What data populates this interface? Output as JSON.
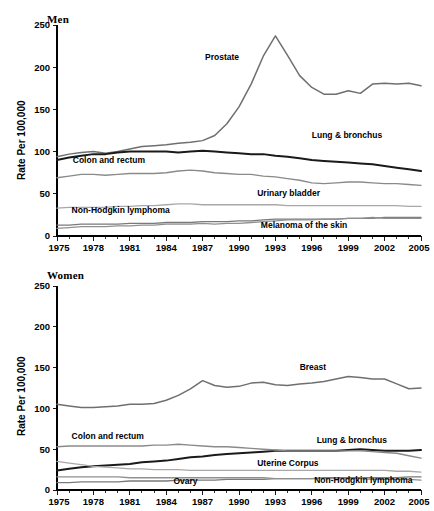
{
  "figure": {
    "background": "#ffffff",
    "panels": [
      "Men",
      "Women"
    ]
  },
  "men": {
    "title": "Men",
    "ylabel": "Rate Per 100,000"
  },
  "women": {
    "title": "Women",
    "ylabel": "Rate Per 100,000"
  },
  "chart_data": [
    {
      "type": "line",
      "title": "Men",
      "xlabel": "",
      "ylabel": "Rate Per 100,000",
      "xlim": [
        1975,
        2005
      ],
      "ylim": [
        0,
        250
      ],
      "yticks": [
        0,
        50,
        100,
        150,
        200,
        250
      ],
      "xticks": [
        1975,
        1978,
        1981,
        1984,
        1987,
        1990,
        1993,
        1996,
        1999,
        2002,
        2005
      ],
      "xtick_minor_step": 1,
      "grid": false,
      "legend": "inline-annotations",
      "x": [
        1975,
        1976,
        1977,
        1978,
        1979,
        1980,
        1981,
        1982,
        1983,
        1984,
        1985,
        1986,
        1987,
        1988,
        1989,
        1990,
        1991,
        1992,
        1993,
        1994,
        1995,
        1996,
        1997,
        1998,
        1999,
        2000,
        2001,
        2002,
        2003,
        2004,
        2005
      ],
      "series": [
        {
          "name": "Prostate",
          "color": "#6f6f6f",
          "width": 1.5,
          "label_x": 1987.2,
          "label_y": 208,
          "values": [
            94,
            97,
            99,
            100,
            98,
            100,
            103,
            106,
            107,
            108,
            110,
            111,
            113,
            119,
            133,
            153,
            180,
            213,
            237,
            214,
            190,
            176,
            168,
            168,
            172,
            169,
            180,
            181,
            180,
            181,
            178,
            167,
            159,
            152,
            147
          ]
        },
        {
          "name": "Lung & bronchus",
          "color": "#1a1a1a",
          "width": 2.0,
          "label_x": 1996.0,
          "label_y": 116,
          "values": [
            90,
            93,
            95,
            97,
            97,
            99,
            100,
            100,
            100,
            100,
            99,
            100,
            101,
            100,
            99,
            98,
            97,
            97,
            95,
            94,
            92,
            90,
            89,
            88,
            87,
            86,
            85,
            83,
            81,
            79,
            77,
            74,
            72,
            70
          ]
        },
        {
          "name": "Colon and rectum",
          "color": "#8a8a8a",
          "width": 1.4,
          "label_x": 1976.3,
          "label_y": 86,
          "values": [
            69,
            71,
            73,
            73,
            72,
            73,
            74,
            74,
            74,
            75,
            77,
            78,
            77,
            75,
            74,
            73,
            73,
            71,
            70,
            68,
            66,
            63,
            62,
            63,
            64,
            64,
            63,
            62,
            62,
            61,
            60,
            58,
            56,
            54,
            52
          ]
        },
        {
          "name": "Urinary bladder",
          "color": "#a8a8a8",
          "width": 1.3,
          "label_x": 1991.5,
          "label_y": 47,
          "values": [
            33,
            34,
            34,
            34,
            34,
            35,
            35,
            36,
            36,
            37,
            38,
            38,
            37,
            37,
            37,
            37,
            37,
            37,
            37,
            36,
            36,
            36,
            36,
            36,
            36,
            36,
            36,
            36,
            36,
            35,
            35,
            35,
            35,
            34,
            34
          ]
        },
        {
          "name": "Non-Hodgkin lymphoma",
          "color": "#7a7a7a",
          "width": 1.3,
          "label_x": 1976.2,
          "label_y": 27,
          "values": [
            13,
            13,
            14,
            14,
            14,
            14,
            15,
            15,
            15,
            16,
            16,
            16,
            17,
            17,
            17,
            18,
            18,
            19,
            20,
            20,
            20,
            20,
            20,
            20,
            21,
            21,
            21,
            22,
            22,
            22,
            22,
            22,
            22,
            23,
            23
          ]
        },
        {
          "name": "Melanoma of the skin",
          "color": "#909090",
          "width": 1.3,
          "label_x": 1991.8,
          "label_y": 9,
          "values": [
            9,
            10,
            11,
            11,
            11,
            12,
            12,
            13,
            13,
            14,
            14,
            14,
            15,
            14,
            15,
            15,
            16,
            17,
            18,
            19,
            19,
            19,
            20,
            20,
            21,
            21,
            22,
            21,
            21,
            21,
            21,
            21,
            21,
            22,
            22
          ]
        }
      ]
    },
    {
      "type": "line",
      "title": "Women",
      "xlabel": "",
      "ylabel": "Rate Per 100,000",
      "xlim": [
        1975,
        2005
      ],
      "ylim": [
        0,
        250
      ],
      "yticks": [
        0,
        50,
        100,
        150,
        200,
        250
      ],
      "xticks": [
        1975,
        1978,
        1981,
        1984,
        1987,
        1990,
        1993,
        1996,
        1999,
        2002,
        2005
      ],
      "xtick_minor_step": 1,
      "grid": false,
      "legend": "inline-annotations",
      "x": [
        1975,
        1976,
        1977,
        1978,
        1979,
        1980,
        1981,
        1982,
        1983,
        1984,
        1985,
        1986,
        1987,
        1988,
        1989,
        1990,
        1991,
        1992,
        1993,
        1994,
        1995,
        1996,
        1997,
        1998,
        1999,
        2000,
        2001,
        2002,
        2003,
        2004,
        2005
      ],
      "series": [
        {
          "name": "Breast",
          "color": "#6f6f6f",
          "width": 1.5,
          "label_x": 1995.0,
          "label_y": 147,
          "values": [
            105,
            103,
            101,
            101,
            102,
            103,
            105,
            105,
            106,
            110,
            116,
            124,
            134,
            128,
            126,
            127,
            131,
            132,
            129,
            128,
            130,
            131,
            133,
            136,
            139,
            138,
            136,
            136,
            130,
            124,
            125,
            123,
            121
          ]
        },
        {
          "name": "Lung & bronchus",
          "color": "#1a1a1a",
          "width": 2.0,
          "label_x": 1996.4,
          "label_y": 57,
          "values": [
            24,
            26,
            28,
            29,
            30,
            31,
            32,
            34,
            35,
            36,
            38,
            40,
            41,
            43,
            44,
            45,
            46,
            47,
            48,
            48,
            48,
            48,
            48,
            48,
            49,
            50,
            49,
            48,
            48,
            48,
            49
          ]
        },
        {
          "name": "Colon and rectum",
          "color": "#8a8a8a",
          "width": 1.4,
          "label_x": 1976.2,
          "label_y": 62,
          "values": [
            53,
            54,
            54,
            54,
            54,
            54,
            54,
            54,
            55,
            55,
            56,
            55,
            54,
            53,
            53,
            52,
            51,
            50,
            49,
            48,
            48,
            48,
            48,
            48,
            48,
            48,
            47,
            46,
            45,
            42,
            39
          ]
        },
        {
          "name": "Uterine Corpus",
          "color": "#a8a8a8",
          "width": 1.3,
          "label_x": 1991.5,
          "label_y": 30,
          "values": [
            35,
            33,
            31,
            29,
            28,
            27,
            26,
            26,
            25,
            25,
            25,
            24,
            24,
            24,
            24,
            24,
            24,
            24,
            24,
            24,
            24,
            24,
            24,
            24,
            24,
            24,
            24,
            24,
            23,
            23,
            22
          ]
        },
        {
          "name": "Non-Hodgkin lymphoma",
          "color": "#7a7a7a",
          "width": 1.3,
          "label_x": 1996.2,
          "label_y": 8,
          "values": [
            9,
            9,
            10,
            10,
            10,
            10,
            11,
            11,
            11,
            11,
            12,
            12,
            12,
            12,
            13,
            13,
            13,
            13,
            14,
            14,
            14,
            14,
            15,
            15,
            15,
            15,
            15,
            15,
            15,
            16,
            16
          ]
        },
        {
          "name": "Ovary",
          "color": "#909090",
          "width": 1.3,
          "label_x": 1984.6,
          "label_y": 7,
          "values": [
            16,
            16,
            16,
            16,
            16,
            16,
            15,
            15,
            15,
            15,
            15,
            15,
            15,
            15,
            15,
            15,
            15,
            15,
            14,
            14,
            14,
            14,
            14,
            14,
            14,
            14,
            13,
            13,
            13,
            13,
            12
          ]
        }
      ]
    }
  ]
}
